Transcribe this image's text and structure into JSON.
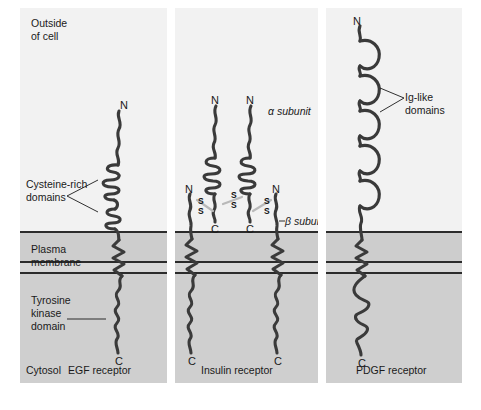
{
  "figure": {
    "type": "biological-diagram",
    "regions": {
      "outside_label": "Outside\nof cell",
      "membrane_label": "Plasma\nmembrane",
      "cytosol_label": "Cytosol"
    },
    "colors": {
      "extracellular_bg": "#f2f2f2",
      "membrane_bg": "#cdcdcd",
      "cytosol_bg": "#cfcfcf",
      "chain_stroke": "#3a3a3a",
      "line_dark": "#2b2b2b",
      "page_bg": "#ffffff"
    }
  },
  "panels": [
    {
      "id": "egf",
      "name": "EGF receptor",
      "caption": "EGF receptor",
      "n_terminus": "N",
      "c_terminus": "C",
      "annotations": [
        {
          "label": "Cysteine-rich\ndomains",
          "target": "extracellular coiled regions"
        },
        {
          "label": "Tyrosine\nkinase\ndomain",
          "target": "cytosolic wavy region"
        }
      ],
      "chains": 1,
      "domains": {
        "cysteine_rich": 2,
        "transmembrane": 1,
        "kinase": 1
      }
    },
    {
      "id": "insulin",
      "name": "Insulin receptor",
      "caption": "Insulin receptor",
      "annotations": [
        {
          "label": "α subunit",
          "target": "upper extracellular chains"
        },
        {
          "label": "β subunit",
          "target": "membrane-spanning chains"
        }
      ],
      "termini": {
        "alpha_n": "N",
        "alpha_c": "C",
        "beta_n": "N",
        "beta_c": "C"
      },
      "disulfide_label": "S",
      "disulfide_bonds": 3,
      "chains": 4,
      "domains": {
        "alpha_subunits": 2,
        "beta_subunits": 2,
        "kinase": 2
      }
    },
    {
      "id": "pdgf",
      "name": "PDGF receptor",
      "caption": "PDGF receptor",
      "n_terminus": "N",
      "c_terminus": "C",
      "annotations": [
        {
          "label": "Ig-like\ndomains",
          "target": "extracellular loop domains"
        }
      ],
      "chains": 1,
      "domains": {
        "ig_like": 5,
        "transmembrane": 1,
        "kinase_split": 2
      }
    }
  ],
  "captions": {
    "egf": "EGF receptor",
    "insulin": "Insulin receptor",
    "pdgf": "PDGF receptor"
  },
  "labels": {
    "outside_line1": "Outside",
    "outside_line2": "of cell",
    "cysteine_line1": "Cysteine-rich",
    "cysteine_line2": "domains",
    "plasma_line1": "Plasma",
    "plasma_line2": "membrane",
    "tyrosine_line1": "Tyrosine",
    "tyrosine_line2": "kinase",
    "tyrosine_line3": "domain",
    "cytosol": "Cytosol",
    "alpha_subunit": "α subunit",
    "beta_subunit": "β subunit",
    "ig_line1": "Ig-like",
    "ig_line2": "domains",
    "N": "N",
    "C": "C",
    "S": "S"
  }
}
